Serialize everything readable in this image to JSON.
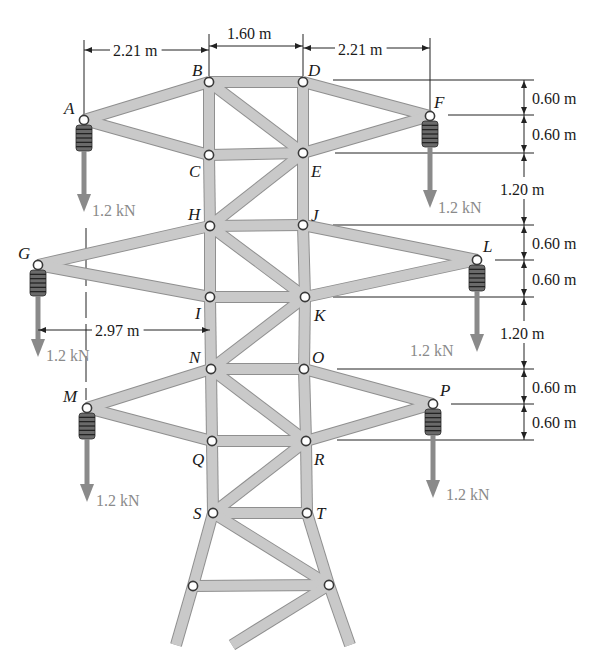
{
  "diagram": {
    "type": "planar-truss",
    "nodes": [
      {
        "id": "A",
        "x": 84,
        "y": 120,
        "label_dx": -20,
        "label_dy": -6
      },
      {
        "id": "B",
        "x": 209,
        "y": 82,
        "label_dx": -17,
        "label_dy": -6
      },
      {
        "id": "C",
        "x": 209,
        "y": 155,
        "label_dx": -20,
        "label_dy": 22
      },
      {
        "id": "D",
        "x": 303,
        "y": 82,
        "label_dx": 5,
        "label_dy": -6
      },
      {
        "id": "E",
        "x": 303,
        "y": 153,
        "label_dx": 8,
        "label_dy": 24
      },
      {
        "id": "F",
        "x": 430,
        "y": 116,
        "label_dx": 4,
        "label_dy": -8
      },
      {
        "id": "G",
        "x": 38,
        "y": 265,
        "label_dx": -20,
        "label_dy": -6
      },
      {
        "id": "H",
        "x": 210,
        "y": 226,
        "label_dx": -22,
        "label_dy": -6
      },
      {
        "id": "I",
        "x": 210,
        "y": 297,
        "label_dx": -15,
        "label_dy": 22
      },
      {
        "id": "J",
        "x": 303,
        "y": 225,
        "label_dx": 8,
        "label_dy": -4
      },
      {
        "id": "K",
        "x": 305,
        "y": 297,
        "label_dx": 9,
        "label_dy": 24
      },
      {
        "id": "L",
        "x": 477,
        "y": 260,
        "label_dx": 6,
        "label_dy": -8
      },
      {
        "id": "M",
        "x": 87,
        "y": 408,
        "label_dx": -24,
        "label_dy": -6
      },
      {
        "id": "N",
        "x": 211,
        "y": 369,
        "label_dx": -22,
        "label_dy": -6
      },
      {
        "id": "O",
        "x": 304,
        "y": 369,
        "label_dx": 8,
        "label_dy": -6
      },
      {
        "id": "P",
        "x": 433,
        "y": 404,
        "label_dx": 7,
        "label_dy": -8
      },
      {
        "id": "Q",
        "x": 212,
        "y": 441,
        "label_dx": -20,
        "label_dy": 24
      },
      {
        "id": "R",
        "x": 306,
        "y": 441,
        "label_dx": 8,
        "label_dy": 24
      },
      {
        "id": "S",
        "x": 213,
        "y": 513,
        "label_dx": -20,
        "label_dy": 6
      },
      {
        "id": "T",
        "x": 307,
        "y": 513,
        "label_dx": 9,
        "label_dy": 6
      },
      {
        "id": "",
        "x": 193,
        "y": 586,
        "label_dx": 0,
        "label_dy": 0
      },
      {
        "id": "",
        "x": 329,
        "y": 585,
        "label_dx": 0,
        "label_dy": 0
      }
    ],
    "members": [
      [
        "A",
        "B"
      ],
      [
        "A",
        "C"
      ],
      [
        "B",
        "D"
      ],
      [
        "B",
        "C"
      ],
      [
        "D",
        "E"
      ],
      [
        "B",
        "E"
      ],
      [
        "D",
        "F"
      ],
      [
        "E",
        "F"
      ],
      [
        "C",
        "E"
      ],
      [
        "C",
        "H"
      ],
      [
        "E",
        "J"
      ],
      [
        "E",
        "H"
      ],
      [
        "H",
        "J"
      ],
      [
        "G",
        "H"
      ],
      [
        "G",
        "I"
      ],
      [
        "H",
        "I"
      ],
      [
        "J",
        "K"
      ],
      [
        "H",
        "K"
      ],
      [
        "J",
        "L"
      ],
      [
        "K",
        "L"
      ],
      [
        "I",
        "K"
      ],
      [
        "I",
        "N"
      ],
      [
        "K",
        "O"
      ],
      [
        "K",
        "N"
      ],
      [
        "N",
        "O"
      ],
      [
        "M",
        "N"
      ],
      [
        "M",
        "Q"
      ],
      [
        "N",
        "Q"
      ],
      [
        "O",
        "R"
      ],
      [
        "N",
        "R"
      ],
      [
        "O",
        "P"
      ],
      [
        "R",
        "P"
      ],
      [
        "Q",
        "R"
      ],
      [
        "Q",
        "S"
      ],
      [
        "R",
        "T"
      ],
      [
        "R",
        "S"
      ],
      [
        "S",
        "T"
      ]
    ],
    "lower_section": {
      "members": [
        [
          [
            213,
            513
          ],
          [
            193,
            586
          ]
        ],
        [
          [
            307,
            513
          ],
          [
            329,
            585
          ]
        ],
        [
          [
            213,
            513
          ],
          [
            329,
            585
          ]
        ],
        [
          [
            193,
            586
          ],
          [
            329,
            585
          ]
        ],
        [
          [
            193,
            586
          ],
          [
            176,
            645
          ]
        ],
        [
          [
            329,
            585
          ],
          [
            350,
            645
          ]
        ],
        [
          [
            329,
            585
          ],
          [
            232,
            645
          ]
        ]
      ]
    },
    "loads": [
      {
        "node": "A",
        "value": "1.2 kN",
        "arrow_tip_y": 212,
        "label_x": 92,
        "label_y": 216
      },
      {
        "node": "F",
        "value": "1.2 kN",
        "arrow_tip_y": 208,
        "label_x": 438,
        "label_y": 213
      },
      {
        "node": "G",
        "value": "1.2 kN",
        "arrow_tip_y": 357,
        "label_x": 46,
        "label_y": 361
      },
      {
        "node": "L",
        "value": "1.2 kN",
        "arrow_tip_y": 352,
        "label_x": 410,
        "label_y": 356
      },
      {
        "node": "M",
        "value": "1.2 kN",
        "arrow_tip_y": 502,
        "label_x": 96,
        "label_y": 506
      },
      {
        "node": "P",
        "value": "1.2 kN",
        "arrow_tip_y": 498,
        "label_x": 446,
        "label_y": 500
      }
    ],
    "horizontal_dimensions": [
      {
        "label": "2.21 m",
        "x1": 84,
        "x2": 209,
        "y": 50,
        "text_x": 113,
        "text_y": 56
      },
      {
        "label": "1.60 m",
        "x1": 209,
        "x2": 303,
        "y": 46,
        "text_x": 227,
        "text_y": 39
      },
      {
        "label": "2.21 m",
        "x1": 303,
        "x2": 430,
        "y": 48,
        "text_x": 338,
        "text_y": 55
      },
      {
        "label": "2.97 m",
        "x1": 38,
        "x2": 210,
        "y": 330,
        "text_x": 95,
        "text_y": 336
      }
    ],
    "vertical_dimensions": {
      "x": 524,
      "text_x": 530,
      "levels_y": [
        80,
        115,
        153,
        225,
        260,
        297,
        369,
        404,
        440
      ],
      "segments": [
        {
          "label": "0.60 m",
          "y1": 80,
          "y2": 115
        },
        {
          "label": "0.60 m",
          "y1": 115,
          "y2": 153
        },
        {
          "label": "1.20 m",
          "y1": 153,
          "y2": 225
        },
        {
          "label": "0.60 m",
          "y1": 225,
          "y2": 260
        },
        {
          "label": "0.60 m",
          "y1": 260,
          "y2": 297
        },
        {
          "label": "1.20 m",
          "y1": 297,
          "y2": 369
        },
        {
          "label": "0.60 m",
          "y1": 369,
          "y2": 404
        },
        {
          "label": "0.60 m",
          "y1": 404,
          "y2": 440
        }
      ]
    },
    "colors": {
      "member_fill": "#c9c9c9",
      "member_edge": "#8f8f8f",
      "load_arrow": "#8a8a8a",
      "text": "#1a1a1a",
      "insulator": "#6a6a6a"
    }
  }
}
